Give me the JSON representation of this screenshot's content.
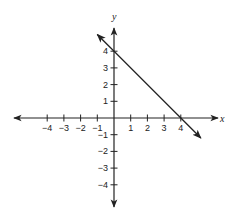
{
  "chart_data": {
    "type": "line",
    "title": "",
    "xlabel": "x",
    "ylabel": "y",
    "xlim": [
      -5.5,
      6
    ],
    "ylim": [
      -5.3,
      5.4
    ],
    "grid": false,
    "x_ticks": [
      -4,
      -3,
      -2,
      -1,
      1,
      2,
      3,
      4
    ],
    "y_ticks": [
      4,
      3,
      2,
      1,
      -1,
      -2,
      -3,
      -4
    ],
    "x_tick_labels": [
      "−4",
      "−3",
      "−2",
      "−1",
      "1",
      "2",
      "3",
      "4"
    ],
    "y_tick_labels": [
      "4",
      "3",
      "2",
      "1",
      "−1",
      "−2",
      "−3",
      "−4"
    ],
    "series": [
      {
        "name": "line",
        "equation": "y = -x + 4",
        "x": [
          -1,
          0,
          4,
          5.2
        ],
        "y": [
          5,
          4,
          0,
          -1.2
        ],
        "arrows_both_ends": true,
        "color": "#222222"
      }
    ]
  },
  "layout": {
    "origin_px": [
      114,
      118
    ],
    "unit_px": 16.7
  }
}
